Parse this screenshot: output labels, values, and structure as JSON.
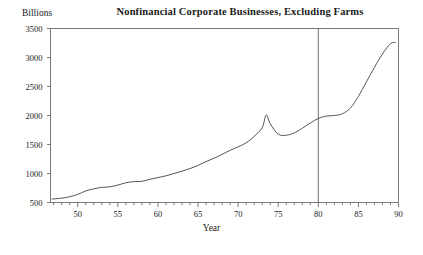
{
  "chart_data": {
    "type": "line",
    "title": "Nonfinancial Corporate Businesses, Excluding Farms",
    "xlabel": "Year",
    "ylabel": "Billions",
    "xlim": [
      46.6,
      90
    ],
    "ylim": [
      500,
      3500
    ],
    "grid": false,
    "legend": null,
    "y_ticks": [
      500,
      1000,
      1500,
      2000,
      2500,
      3000,
      3500
    ],
    "y_tick_labels": [
      "500",
      "1000",
      "1500",
      "2000",
      "2500",
      "3000",
      "3500"
    ],
    "x_ticks": [
      50,
      55,
      60,
      65,
      70,
      75,
      80,
      85,
      90
    ],
    "x_tick_labels": [
      "50",
      "55",
      "60",
      "65",
      "70",
      "75",
      "80",
      "85",
      "90"
    ],
    "x_minor_tick_step": 1,
    "annotations": [
      {
        "type": "vertical-line",
        "x": 80,
        "label": "1980 reference line"
      }
    ],
    "series": [
      {
        "name": "Nonfinancial corporate business",
        "color": "#555555",
        "x": [
          46.8,
          48,
          49,
          50,
          51,
          52,
          53,
          54,
          55,
          56,
          57,
          58,
          59,
          60,
          61,
          62,
          63,
          64,
          65,
          66,
          67,
          68,
          69,
          70,
          71,
          72,
          73,
          73.5,
          74,
          75,
          76,
          77,
          78,
          79,
          80,
          81,
          82,
          83,
          84,
          85,
          86,
          87,
          88,
          89,
          89.6
        ],
        "y": [
          560,
          575,
          600,
          640,
          700,
          735,
          760,
          770,
          800,
          840,
          860,
          865,
          900,
          930,
          960,
          1000,
          1040,
          1085,
          1140,
          1205,
          1265,
          1330,
          1400,
          1460,
          1530,
          1640,
          1790,
          2010,
          1860,
          1680,
          1660,
          1700,
          1780,
          1870,
          1950,
          1990,
          2000,
          2030,
          2130,
          2330,
          2580,
          2830,
          3060,
          3240,
          3255
        ]
      }
    ]
  }
}
